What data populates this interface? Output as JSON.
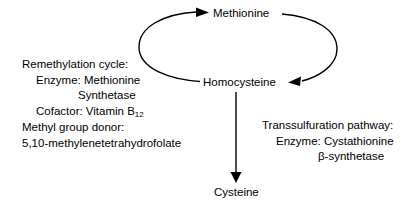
{
  "diagram": {
    "background_color": "#ffffff",
    "stroke_color": "#000000",
    "nodes": [
      {
        "id": "methionine",
        "label": "Methionine"
      },
      {
        "id": "homocysteine",
        "label": "Homocysteine"
      },
      {
        "id": "cysteine",
        "label": "Cysteine"
      }
    ],
    "edges": [
      {
        "id": "remethylation-arc",
        "from": "homocysteine",
        "to": "methionine",
        "shape": "arc-left",
        "arrowhead": "right"
      },
      {
        "id": "transmethylation-arc",
        "from": "methionine",
        "to": "homocysteine",
        "shape": "arc-right",
        "arrowhead": "left"
      },
      {
        "id": "transsulfuration-arrow",
        "from": "homocysteine",
        "to": "cysteine",
        "shape": "straight-vertical",
        "arrowhead": "down"
      }
    ],
    "annotations": {
      "remethylation": {
        "heading": "Remethylation cycle:",
        "enzyme_label": "Enzyme:  Methionine",
        "enzyme_label_cont": "Synthetase",
        "cofactor_label": "Cofactor:  Vitamin B",
        "cofactor_subscript": "12",
        "donor_heading": "Methyl group donor:",
        "donor_value": "5,10-methylenetetrahydrofolate"
      },
      "transsulfuration": {
        "heading": "Transsulfuration pathway:",
        "enzyme_label": "Enzyme:  Cystathionine",
        "enzyme_label_cont": "β-synthetase"
      }
    }
  }
}
